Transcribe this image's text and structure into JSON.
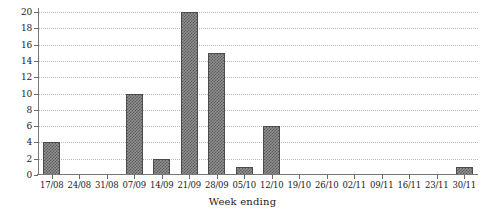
{
  "chart_data": {
    "type": "bar",
    "title": "",
    "subtitle": "",
    "xlabel": "Week ending",
    "ylabel": "",
    "categories": [
      "17/08",
      "24/08",
      "31/08",
      "07/09",
      "14/09",
      "21/09",
      "28/09",
      "05/10",
      "12/10",
      "19/10",
      "26/10",
      "02/11",
      "09/11",
      "16/11",
      "23/11",
      "30/11"
    ],
    "values": [
      4,
      0,
      0,
      10,
      2,
      20,
      15,
      1,
      6,
      0,
      0,
      0,
      0,
      0,
      0,
      1
    ],
    "ylim": [
      0,
      20
    ],
    "yticks": [
      0,
      2,
      4,
      6,
      8,
      10,
      12,
      14,
      16,
      18,
      20
    ],
    "ytick_labels": [
      "0",
      "2",
      "4",
      "6",
      "8",
      "10",
      "12",
      "14",
      "16",
      "18",
      "20"
    ],
    "grid": true,
    "grid_axis": "y",
    "grid_style": "dotted",
    "legend": false,
    "legend_position": "none",
    "bar_fill": "#8f8f8f",
    "bar_pattern": "checkerboard-dither",
    "bar_edge_color": "#4c4c4c",
    "axis_color": "#767676",
    "grid_color": "#b9b9b9",
    "background": "#ffffff"
  }
}
